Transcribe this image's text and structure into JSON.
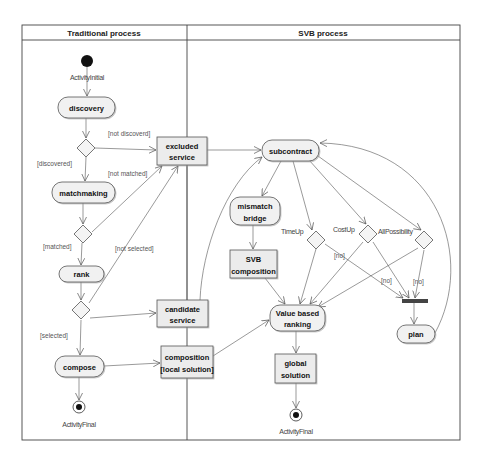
{
  "diagram": {
    "type": "UML activity diagram",
    "lanes": [
      {
        "id": "traditional",
        "title": "Traditional process"
      },
      {
        "id": "svb",
        "title": "SVB process"
      }
    ],
    "nodes": {
      "initial": {
        "kind": "initial",
        "label": "ActivityInitial"
      },
      "discovery": {
        "kind": "action",
        "label": "discovery"
      },
      "matchmaking": {
        "kind": "action",
        "label": "matchmaking"
      },
      "rank": {
        "kind": "action",
        "label": "rank"
      },
      "compose": {
        "kind": "action",
        "label": "compose"
      },
      "final_traditional": {
        "kind": "final",
        "label": "ActivityFinal"
      },
      "excluded_service": {
        "kind": "object",
        "line1": "excluded",
        "line2": "service"
      },
      "candidate_service": {
        "kind": "object",
        "line1": "candidate",
        "line2": "service"
      },
      "composition_local": {
        "kind": "object",
        "line1": "composition",
        "line2": "[local solution]"
      },
      "subcontract": {
        "kind": "action",
        "label": "subcontract"
      },
      "mismatch_bridge": {
        "kind": "action",
        "line1": "mismatch",
        "line2": "bridge"
      },
      "svb_composition": {
        "kind": "object",
        "line1": "SVB",
        "line2": "composition"
      },
      "value_based_ranking": {
        "kind": "action",
        "line1": "Value based",
        "line2": "ranking"
      },
      "global_solution": {
        "kind": "object",
        "line1": "global",
        "line2": "solution"
      },
      "final_svb": {
        "kind": "final",
        "label": "ActivityFinal"
      },
      "timeup": {
        "kind": "decision",
        "label": "TimeUp"
      },
      "costup": {
        "kind": "decision",
        "label": "CostUp"
      },
      "allpossibility": {
        "kind": "decision",
        "label": "AllPossibility"
      },
      "join_bar": {
        "kind": "join"
      },
      "plan": {
        "kind": "action",
        "label": "plan"
      }
    },
    "guards": {
      "not_discovered": "[not discoverd]",
      "discovered": "[discovered]",
      "not_matched": "[not matched]",
      "matched": "[matched]",
      "not_selected": "[not selected]",
      "selected": "[selected]",
      "timeup_no": "[no]",
      "costup_no": "[no]",
      "allpossibility_no": "[no]"
    },
    "colors": {
      "line": "#555555",
      "node_fill": "#f1f1f1",
      "object_fill": "#ececec",
      "join_bar": "#444444"
    }
  }
}
